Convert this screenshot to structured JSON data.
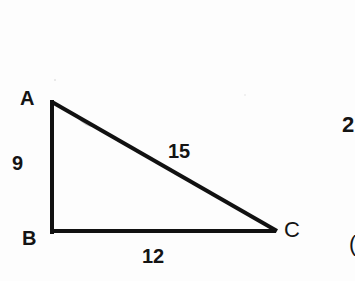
{
  "diagram": {
    "type": "right-triangle",
    "vertices": {
      "A": {
        "label": "A",
        "x": 52,
        "y": 102
      },
      "B": {
        "label": "B",
        "x": 52,
        "y": 231
      },
      "C": {
        "label": "C",
        "x": 276,
        "y": 231
      }
    },
    "sides": {
      "AB": {
        "label": "9"
      },
      "BC": {
        "label": "12"
      },
      "AC": {
        "label": "15"
      }
    },
    "right_angle_at": "B",
    "stroke_color": "#111111",
    "text_color": "#141414",
    "background": "#fdfdfd"
  },
  "adjacent_fragments": {
    "top_right": "2",
    "bottom_right": "("
  }
}
